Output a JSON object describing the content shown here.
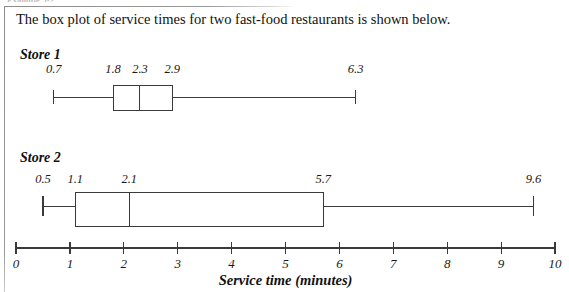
{
  "page": {
    "scan_header": "Example 5-2",
    "intro": "The box plot of service times for two fast-food restaurants is shown below."
  },
  "axis": {
    "caption": "Service time (minutes)",
    "ticks": [
      "0",
      "1",
      "2",
      "3",
      "4",
      "5",
      "6",
      "7",
      "8",
      "9",
      "10"
    ],
    "min": 0,
    "max": 10
  },
  "plots": [
    {
      "title": "Store 1",
      "labels": [
        "0.7",
        "1.8",
        "2.3",
        "2.9",
        "6.3"
      ],
      "min": 0.7,
      "q1": 1.8,
      "median": 2.3,
      "q3": 2.9,
      "max": 6.3
    },
    {
      "title": "Store 2",
      "labels": [
        "0.5",
        "1.1",
        "2.1",
        "5.7",
        "9.6"
      ],
      "min": 0.5,
      "q1": 1.1,
      "median": 2.1,
      "q3": 5.7,
      "max": 9.6
    }
  ],
  "chart_data": {
    "type": "box",
    "title": "The box plot of service times for two fast-food restaurants is shown below.",
    "xlabel": "Service time (minutes)",
    "ylabel": "",
    "xlim": [
      0,
      10
    ],
    "xticks": [
      0,
      1,
      2,
      3,
      4,
      5,
      6,
      7,
      8,
      9,
      10
    ],
    "grid": false,
    "legend": "none",
    "series": [
      {
        "name": "Store 1",
        "min": 0.7,
        "q1": 1.8,
        "median": 2.3,
        "q3": 2.9,
        "max": 6.3
      },
      {
        "name": "Store 2",
        "min": 0.5,
        "q1": 1.1,
        "median": 2.1,
        "q3": 5.7,
        "max": 9.6
      }
    ]
  }
}
